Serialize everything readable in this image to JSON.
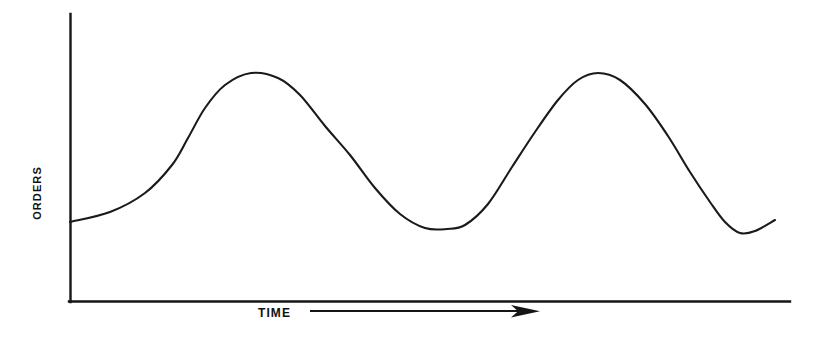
{
  "figure": {
    "background_color": "#ffffff",
    "ink_color": "#151515",
    "width": 822,
    "height": 338
  },
  "axes": {
    "y_axis_label": "ORDERS",
    "x_axis_label": "TIME",
    "x_direction_arrow": "arrow-right-icon",
    "y_axis": {
      "x": 70,
      "y_top": 14,
      "y_bottom": 301
    },
    "x_axis": {
      "y": 301,
      "x_left": 70,
      "x_right": 790
    }
  },
  "chart_data": {
    "type": "line",
    "title": "",
    "subtitle": "",
    "xlabel": "TIME",
    "ylabel": "ORDERS",
    "grid": false,
    "legend": "none",
    "axis_ticks": "none",
    "axis_tick_labels": "none",
    "x": [
      0,
      0.09,
      0.16,
      0.21,
      0.25,
      0.29,
      0.34,
      0.4,
      0.46,
      0.5,
      0.55,
      0.6,
      0.66,
      0.71,
      0.74,
      0.78,
      0.83,
      0.88,
      0.93,
      0.96,
      1.0
    ],
    "y": [
      0.27,
      0.33,
      0.45,
      0.62,
      0.8,
      0.92,
      0.97,
      0.94,
      0.8,
      0.62,
      0.42,
      0.27,
      0.24,
      0.3,
      0.45,
      0.66,
      0.86,
      0.97,
      0.88,
      0.58,
      0.3
    ],
    "series": [
      {
        "name": "orders",
        "points_px": [
          [
            70,
            222
          ],
          [
            110,
            212
          ],
          [
            145,
            193
          ],
          [
            172,
            165
          ],
          [
            188,
            138
          ],
          [
            205,
            108
          ],
          [
            225,
            85
          ],
          [
            251,
            73
          ],
          [
            278,
            78
          ],
          [
            300,
            95
          ],
          [
            325,
            126
          ],
          [
            350,
            155
          ],
          [
            375,
            188
          ],
          [
            400,
            214
          ],
          [
            425,
            228
          ],
          [
            447,
            229
          ],
          [
            465,
            225
          ],
          [
            488,
            204
          ],
          [
            512,
            167
          ],
          [
            535,
            132
          ],
          [
            558,
            100
          ],
          [
            578,
            80
          ],
          [
            598,
            73
          ],
          [
            620,
            80
          ],
          [
            645,
            104
          ],
          [
            668,
            136
          ],
          [
            690,
            172
          ],
          [
            710,
            202
          ],
          [
            725,
            222
          ],
          [
            740,
            233
          ],
          [
            755,
            231
          ],
          [
            775,
            220
          ]
        ],
        "ylim_px": [
          73,
          233
        ]
      }
    ],
    "cycles": 2,
    "peaks_px": [
      [
        251,
        73
      ],
      [
        598,
        73
      ]
    ],
    "troughs_px": [
      [
        425,
        228
      ],
      [
        740,
        233
      ]
    ],
    "start_px": [
      70,
      222
    ],
    "end_px": [
      775,
      220
    ]
  },
  "x_direction_arrow": {
    "shaft_x_start": 310,
    "shaft_x_end": 527,
    "shaft_y": 311,
    "head_tip_x": 540
  }
}
